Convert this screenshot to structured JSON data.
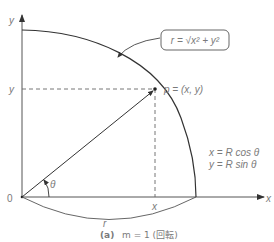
{
  "diagram": {
    "caption": {
      "prefix": "(a)",
      "text": "m = 1 (回転)"
    },
    "axes": {
      "x_label": "x",
      "y_label": "y",
      "origin_label": "0"
    },
    "point": {
      "label": "p = (x, y)"
    },
    "guides": {
      "x_tick_label": "x",
      "y_tick_label": "y"
    },
    "angle_label": "θ",
    "radius_label": "r",
    "callout": {
      "text": "r = √x² + y²"
    },
    "equations": [
      "x = R cos θ",
      "y = R sin θ"
    ],
    "colors": {
      "line": "#333333",
      "text": "#7a7a7a",
      "dashed": "#666666"
    }
  }
}
